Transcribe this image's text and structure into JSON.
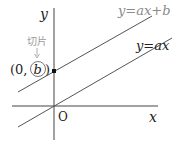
{
  "diagram": {
    "axes": {
      "x_label": "x",
      "y_label": "y",
      "origin_label": "O"
    },
    "lines": [
      {
        "id": "line-with-intercept",
        "label": "y=ax+b",
        "color": "#8a8a8a"
      },
      {
        "id": "line-through-origin",
        "label": "y=ax",
        "color": "#333333"
      }
    ],
    "intercept": {
      "annotation": "切片",
      "point_label_prefix": "(0, ",
      "point_label_var": "b",
      "point_label_suffix": ")",
      "annotation_color": "#9a9a9a"
    },
    "colors": {
      "axis": "#333333",
      "text": "#222222"
    }
  }
}
